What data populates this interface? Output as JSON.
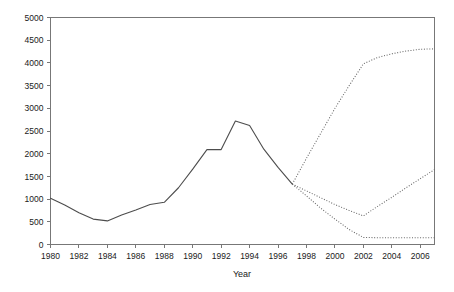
{
  "chart_data": {
    "type": "line",
    "title": "",
    "subtitle": "",
    "xlabel": "Year",
    "ylabel": "",
    "xlim": [
      1980,
      2007
    ],
    "ylim": [
      0,
      5000
    ],
    "grid": false,
    "legend": null,
    "x_ticks": [
      1980,
      1982,
      1984,
      1986,
      1988,
      1990,
      1992,
      1994,
      1996,
      1998,
      2000,
      2002,
      2004,
      2006
    ],
    "x_tick_labels": [
      "1980",
      "1982",
      "1984",
      "1986",
      "1988",
      "1990",
      "1992",
      "1994",
      "1996",
      "1998",
      "2000",
      "2002",
      "2004",
      "2006"
    ],
    "y_ticks": [
      0,
      500,
      1000,
      1500,
      2000,
      2500,
      3000,
      3500,
      4000,
      4500,
      5000
    ],
    "y_tick_labels": [
      "0",
      "500",
      "1000",
      "1500",
      "2000",
      "2500",
      "3000",
      "3500",
      "4000",
      "4500",
      "5000"
    ],
    "series": [
      {
        "name": "historical",
        "style": "solid",
        "x": [
          1980,
          1981,
          1982,
          1983,
          1984,
          1985,
          1986,
          1987,
          1988,
          1989,
          1990,
          1991,
          1992,
          1993,
          1994,
          1995,
          1996,
          1997
        ],
        "values": [
          1020,
          870,
          700,
          560,
          520,
          650,
          760,
          880,
          930,
          1250,
          1660,
          2090,
          2090,
          2720,
          2620,
          2100,
          1700,
          1330
        ]
      },
      {
        "name": "projection-high",
        "style": "dotted",
        "x": [
          1997,
          1998,
          1999,
          2000,
          2001,
          2002,
          2003,
          2004,
          2005,
          2006,
          2007
        ],
        "values": [
          1330,
          1900,
          2450,
          3000,
          3500,
          3980,
          4120,
          4200,
          4260,
          4300,
          4310
        ]
      },
      {
        "name": "projection-mid",
        "style": "dotted",
        "x": [
          1997,
          1998,
          1999,
          2000,
          2001,
          2002,
          2003,
          2004,
          2005,
          2006,
          2007
        ],
        "values": [
          1330,
          1180,
          1030,
          880,
          750,
          630,
          840,
          1040,
          1250,
          1450,
          1650
        ]
      },
      {
        "name": "projection-low",
        "style": "dotted",
        "x": [
          1997,
          1998,
          1999,
          2000,
          2001,
          2002,
          2003,
          2004,
          2005,
          2006,
          2007
        ],
        "values": [
          1330,
          1070,
          800,
          560,
          330,
          155,
          150,
          150,
          150,
          150,
          150
        ]
      }
    ]
  }
}
